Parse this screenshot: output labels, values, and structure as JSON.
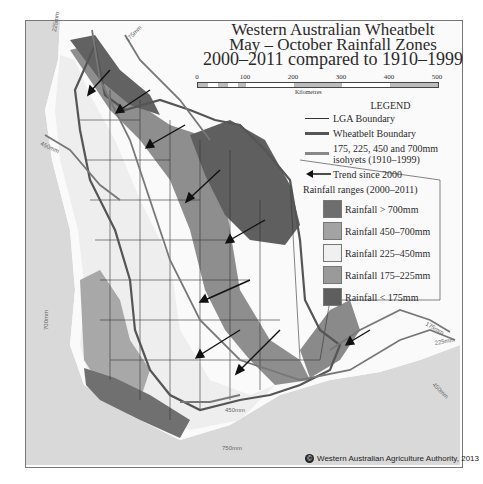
{
  "title": {
    "line1": "Western Australian Wheatbelt",
    "line2": "May – October Rainfall Zones",
    "line3": "2000–2011 compared to 1910–1999"
  },
  "scale_bar": {
    "ticks": [
      "0",
      "100",
      "200",
      "300",
      "400",
      "500"
    ],
    "unit": "Kilometres"
  },
  "legend": {
    "heading": "LEGEND",
    "lines": [
      {
        "symbol": "thin-line",
        "label": "LGA Boundary"
      },
      {
        "symbol": "thick-dark-line",
        "label": "Wheatbelt Boundary"
      },
      {
        "symbol": "thick-gray-line",
        "label": "175, 225, 450 and 700mm isohyets (1910–1999)"
      },
      {
        "symbol": "arrow",
        "label": "Trend since  2000"
      }
    ],
    "ranges_title": "Rainfall ranges (2000–2011)",
    "ranges": [
      {
        "label": "Rainfall > 700mm",
        "color": "#6e6e6e"
      },
      {
        "label": "Rainfall 450–700mm",
        "color": "#a3a3a3"
      },
      {
        "label": "Rainfall 225–450mm",
        "color": "#f0f0f0"
      },
      {
        "label": "Rainfall 175–225mm",
        "color": "#9a9a9a"
      },
      {
        "label": "Rainfall < 175mm",
        "color": "#5e5e5e"
      }
    ]
  },
  "isohyet_labels": [
    "225mm",
    "175mm",
    "450mm",
    "700mm",
    "450mm",
    "750mm",
    "175mm",
    "225mm",
    "450mm"
  ],
  "copyright": "Western Australian Agriculture Authority, 2013",
  "colors": {
    "ocean": "#d9d9d9",
    "land_outside": "#fafafa",
    "wheatbelt_boundary": "#555555",
    "isohyet": "#777777"
  }
}
